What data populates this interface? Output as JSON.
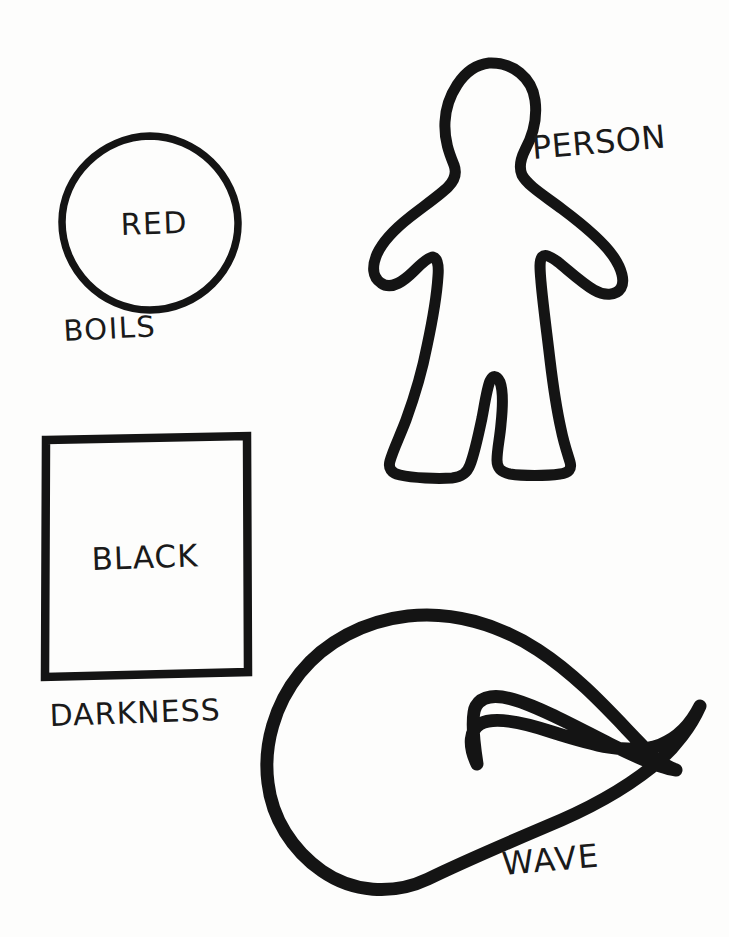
{
  "document": {
    "title": "Hand-drawn shape vocabulary sheet",
    "medium": "black marker on white paper",
    "background_color": "#fdfdfc",
    "ink_color": "#141414"
  },
  "shapes": [
    {
      "id": "circle",
      "icon_name": "circle-shape",
      "inner_label": "RED",
      "caption_label": "BOILS",
      "position": {
        "x": 62,
        "y": 135,
        "width": 176,
        "height": 176
      },
      "stroke_width": 7
    },
    {
      "id": "person",
      "icon_name": "person-silhouette-shape",
      "inner_label": "",
      "caption_label": "PERSON",
      "position": {
        "x": 333,
        "y": 62,
        "width": 292,
        "height": 416
      },
      "stroke_width": 11
    },
    {
      "id": "square",
      "icon_name": "square-shape",
      "inner_label": "BLACK",
      "caption_label": "DARKNESS",
      "position": {
        "x": 44,
        "y": 435,
        "width": 204,
        "height": 243
      },
      "stroke_width": 8
    },
    {
      "id": "wave",
      "icon_name": "wave-shape",
      "inner_label": "",
      "caption_label": "WAVE",
      "position": {
        "x": 268,
        "y": 615,
        "width": 436,
        "height": 270
      },
      "stroke_width": 13
    }
  ],
  "labels": {
    "red": "RED",
    "boils": "BOILS",
    "person": "PERSON",
    "black": "BLACK",
    "darkness": "DARKNESS",
    "wave": "WAVE"
  }
}
